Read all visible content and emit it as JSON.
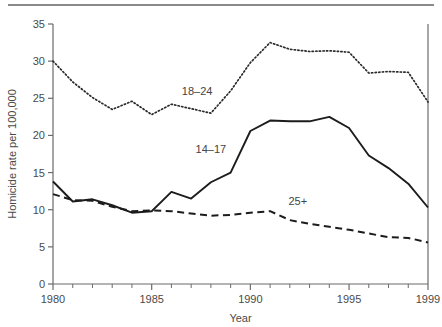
{
  "figure": {
    "has_top_rule": true,
    "background_color": "#ffffff",
    "axis_color": "#6b6b6b",
    "text_color": "#4a4a4a"
  },
  "chart_data": {
    "type": "line",
    "title": "",
    "subtitle": "",
    "xlabel": "Year",
    "ylabel": "Homicide rate per 100,000",
    "xlim": [
      1980,
      1999
    ],
    "ylim": [
      0,
      35
    ],
    "grid": false,
    "legend_position": "inline-annotations",
    "x_tick_labels": [
      "1980",
      "1985",
      "1990",
      "1995",
      "1999"
    ],
    "x_tick_values": [
      1980,
      1985,
      1990,
      1995,
      1999
    ],
    "x_minor_ticks": [
      1981,
      1982,
      1983,
      1984,
      1986,
      1987,
      1988,
      1989,
      1991,
      1992,
      1993,
      1994,
      1996,
      1997,
      1998
    ],
    "y_tick_labels": [
      "0",
      "5",
      "10",
      "15",
      "20",
      "25",
      "30",
      "35"
    ],
    "y_tick_values": [
      0,
      5,
      10,
      15,
      20,
      25,
      30,
      35
    ],
    "x": [
      1980,
      1981,
      1982,
      1983,
      1984,
      1985,
      1986,
      1987,
      1988,
      1989,
      1990,
      1991,
      1992,
      1993,
      1994,
      1995,
      1996,
      1997,
      1998,
      1999
    ],
    "series": [
      {
        "name": "18-24",
        "label": "18–24",
        "style": "dotted",
        "color": "#2b2b2b",
        "label_x": 1987.3,
        "label_y": 25.4,
        "values": [
          30.0,
          27.2,
          25.1,
          23.5,
          24.6,
          22.8,
          24.2,
          23.6,
          23.0,
          26.0,
          29.8,
          32.5,
          31.6,
          31.3,
          31.4,
          31.2,
          28.4,
          28.6,
          28.5,
          24.5
        ]
      },
      {
        "name": "14-17",
        "label": "14–17",
        "style": "solid",
        "color": "#1c1c1c",
        "label_x": 1988.0,
        "label_y": 17.6,
        "values": [
          13.8,
          11.1,
          11.4,
          10.6,
          9.6,
          9.8,
          12.4,
          11.5,
          13.7,
          15.0,
          20.6,
          22.0,
          21.9,
          21.9,
          22.5,
          21.0,
          17.3,
          15.6,
          13.5,
          10.3
        ]
      },
      {
        "name": "25+",
        "label": "25+",
        "style": "dashed",
        "color": "#1c1c1c",
        "label_x": 1992.4,
        "label_y": 10.6,
        "values": [
          12.1,
          11.3,
          11.2,
          10.4,
          9.8,
          9.9,
          9.8,
          9.5,
          9.2,
          9.3,
          9.6,
          9.8,
          8.6,
          8.1,
          7.7,
          7.3,
          6.8,
          6.3,
          6.2,
          5.6
        ]
      }
    ]
  }
}
